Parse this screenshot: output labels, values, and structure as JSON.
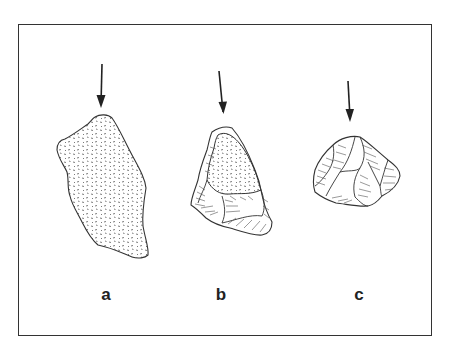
{
  "figure": {
    "specimens": [
      {
        "id": "a",
        "label": "a",
        "surface": "cortex (stippled)"
      },
      {
        "id": "b",
        "label": "b",
        "surface": "partial cortex with flake scars"
      },
      {
        "id": "c",
        "label": "c",
        "surface": "flake scars (no cortex)"
      }
    ],
    "colors": {
      "line": "#333333",
      "background": "#ffffff"
    }
  }
}
